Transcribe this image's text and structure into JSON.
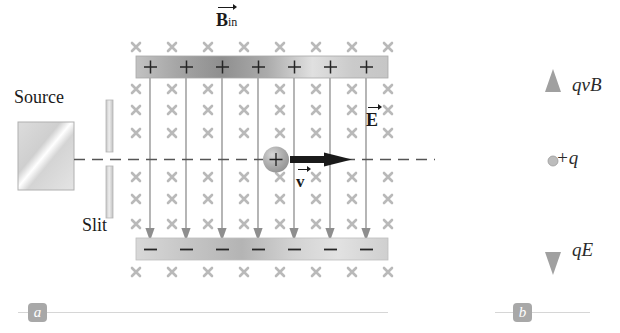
{
  "figure": {
    "panels": [
      {
        "id": "a",
        "label": "a",
        "caption": ""
      },
      {
        "id": "b",
        "label": "b",
        "caption": ""
      }
    ]
  },
  "panel_a": {
    "source_label": "Source",
    "slit_label": "Slit",
    "field_b_symbol": "B",
    "field_b_subscript": "in",
    "field_e_symbol": "E",
    "velocity_symbol": "v",
    "top_plate": {
      "charge_sign": "+",
      "count": 7
    },
    "bottom_plate": {
      "charge_sign": "–",
      "count": 7
    },
    "particle_charge": "+",
    "cross_marks": {
      "columns": 8,
      "rows": 8,
      "glyph": "×"
    },
    "field_lines": 7
  },
  "panel_b": {
    "force_up_label": "qvB",
    "force_down_label": "qE",
    "charge_label": "+q"
  },
  "colors": {
    "cross_gray": "#b9b9b9",
    "field_line": "#8e8e8e",
    "plate_dark": "#9a9a9a",
    "plate_light": "#dcdcdc",
    "arrow_gray": "#a0a0a0",
    "particle": "#a8a8a8",
    "dashed_line": "#555555",
    "badge_bg": "#a8a8a8",
    "rule": "#d6d6d6",
    "text": "#1a1a1a"
  }
}
